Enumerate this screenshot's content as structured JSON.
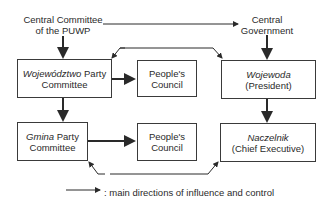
{
  "top": {
    "central_committee": [
      "Central Committee",
      "of the PUWP"
    ],
    "central_government": [
      "Central",
      "Government"
    ]
  },
  "boxes": {
    "wojewodztwo": {
      "italic": "Województwo",
      "rest": " Party",
      "line2": "Committee"
    },
    "peoples_council_1": {
      "line1": "People's",
      "line2": "Council"
    },
    "wojewoda": {
      "italic": "Wojewoda",
      "line2": "(President)"
    },
    "gmina": {
      "italic": "Gmina",
      "rest": " Party",
      "line2": "Committee"
    },
    "peoples_council_2": {
      "line1": "People's",
      "line2": "Council"
    },
    "naczelnik": {
      "italic": "Naczelnik",
      "line2": "(Chief Executive)"
    }
  },
  "legend": {
    "text": ": main directions of influence and control"
  }
}
